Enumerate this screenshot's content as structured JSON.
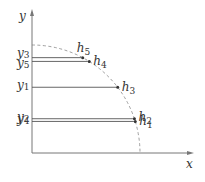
{
  "diagram": {
    "axes": {
      "x_label": "x",
      "y_label": "y"
    },
    "curve": {
      "style": "dashed",
      "shape": "quarter-circle"
    },
    "colors": {
      "axis": "#777777",
      "line": "#555555",
      "curve": "#888888",
      "text": "#333333",
      "dot": "#333333"
    },
    "points": [
      {
        "id": "h1",
        "name": "h",
        "sub": "1",
        "y_label_name": "y",
        "y_label_sub": "4",
        "angle_deg": 17
      },
      {
        "id": "h2",
        "name": "h",
        "sub": "2",
        "y_label_name": "y",
        "y_label_sub": "2",
        "angle_deg": 18.5
      },
      {
        "id": "h3",
        "name": "h",
        "sub": "3",
        "y_label_name": "y",
        "y_label_sub": "1",
        "angle_deg": 37.5
      },
      {
        "id": "h4",
        "name": "h",
        "sub": "4",
        "y_label_name": "y",
        "y_label_sub": "5",
        "angle_deg": 58
      },
      {
        "id": "h5",
        "name": "h",
        "sub": "5",
        "y_label_name": "y",
        "y_label_sub": "3",
        "angle_deg": 62
      }
    ]
  }
}
